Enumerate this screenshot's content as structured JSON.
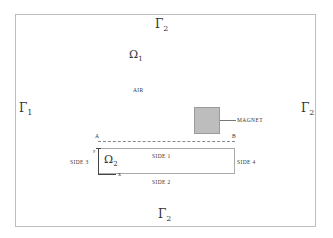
{
  "diagram": {
    "boundaries": {
      "top": {
        "symbol": "Γ",
        "sub": "2"
      },
      "left": {
        "symbol": "Γ",
        "sub": "1"
      },
      "right": {
        "symbol": "Γ",
        "sub": "2"
      },
      "bottom": {
        "symbol": "Γ",
        "sub": "2"
      }
    },
    "domains": {
      "air": {
        "symbol": "Ω",
        "sub": "1",
        "label": "AIR"
      },
      "plate": {
        "symbol": "Ω",
        "sub": "2"
      }
    },
    "magnet_label": "MAGNET",
    "points": {
      "a": "A",
      "b": "B"
    },
    "sides": {
      "side1": "SIDE 1",
      "side2": "SIDE 2",
      "side3": "SIDE 3",
      "side4": "SIDE 4"
    },
    "axes": {
      "y": "y",
      "x": "x"
    },
    "colors": {
      "magnet_fill": "#bdbdbd",
      "frame": "#bdbdbd"
    }
  }
}
